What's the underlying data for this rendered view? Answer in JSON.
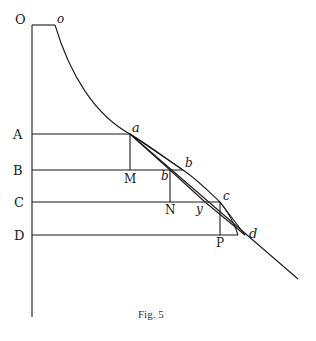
{
  "figure": {
    "caption": "Fig. 5",
    "ink_color": "#1a1a1a",
    "background": "#ffffff"
  },
  "labels": {
    "O": "O",
    "o": "o",
    "A": "A",
    "B": "B",
    "C": "C",
    "D": "D",
    "M": "M",
    "N": "N",
    "P": "P",
    "a": "a",
    "b": "b",
    "b_prime": "b",
    "c": "c",
    "d": "d",
    "y": "y"
  }
}
